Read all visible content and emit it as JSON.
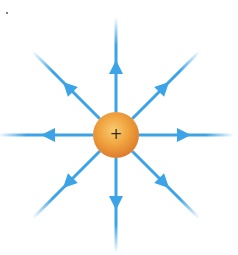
{
  "figure": {
    "charge": {
      "sign": "+",
      "center": [
        116,
        135
      ],
      "radius": 23,
      "color_light": "#f6c366",
      "color_mid": "#f0a040",
      "color_dark": "#d9782a"
    },
    "field_lines": {
      "count": 8,
      "color": "#3ba3e6",
      "fade_color": "#d8f2ff",
      "directions_deg": [
        0,
        45,
        90,
        135,
        180,
        225,
        270,
        315
      ],
      "arrow_direction": "outward"
    }
  }
}
